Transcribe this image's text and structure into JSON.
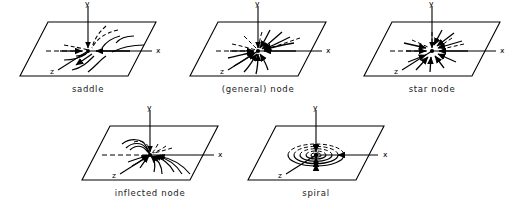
{
  "figure": {
    "title": "",
    "axis_labels": {
      "x": "x",
      "y": "y",
      "z": "z"
    },
    "stroke_color": "#000000",
    "background_color": "#ffffff"
  },
  "panels": [
    {
      "id": "saddle",
      "caption": "saddle",
      "axis_x": "x",
      "axis_y": "y",
      "axis_z": "z",
      "pattern": "saddle",
      "row": 1,
      "column": 1
    },
    {
      "id": "general-node",
      "caption": "(general) node",
      "axis_x": "x",
      "axis_y": "y",
      "axis_z": "z",
      "pattern": "node",
      "row": 1,
      "column": 2
    },
    {
      "id": "star-node",
      "caption": "star node",
      "axis_x": "x",
      "axis_y": "y",
      "axis_z": "z",
      "pattern": "star",
      "row": 1,
      "column": 3
    },
    {
      "id": "inflected-node",
      "caption": "inflected node",
      "axis_x": "x",
      "axis_y": "y",
      "axis_z": "z",
      "pattern": "inflected",
      "row": 2,
      "column": 1
    },
    {
      "id": "spiral",
      "caption": "spiral",
      "axis_x": "x",
      "axis_y": "y",
      "axis_z": "z",
      "pattern": "spiral",
      "row": 2,
      "column": 2
    }
  ]
}
